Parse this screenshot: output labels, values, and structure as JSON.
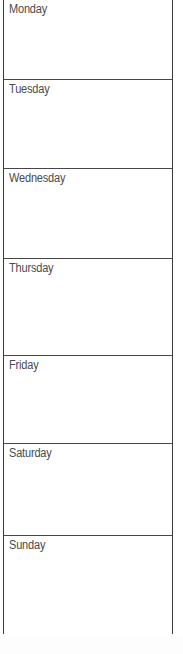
{
  "document": {
    "type": "weekly-planner-table",
    "orientation": "portrait",
    "appearance": "scanned-fax-grayscale",
    "background_color": "#ffffff",
    "border_color": "#45454a",
    "text_color": "#4a4a4e",
    "columns": 1,
    "row_count": 7,
    "first_row_cropped": true
  },
  "rows": [
    {
      "label": "Monday",
      "note": "",
      "height_px": 79,
      "cropped_top": true
    },
    {
      "label": "Tuesday",
      "note": "",
      "height_px": 89,
      "cropped_top": false
    },
    {
      "label": "Wednesday",
      "note": "",
      "height_px": 90,
      "cropped_top": false
    },
    {
      "label": "Thursday",
      "note": "",
      "height_px": 97,
      "cropped_top": false
    },
    {
      "label": "Friday",
      "note": "",
      "height_px": 88,
      "cropped_top": false
    },
    {
      "label": "Saturday",
      "note": "",
      "height_px": 92,
      "cropped_top": false
    },
    {
      "label": "Sunday",
      "note": "",
      "height_px": 99,
      "cropped_top": false
    }
  ]
}
